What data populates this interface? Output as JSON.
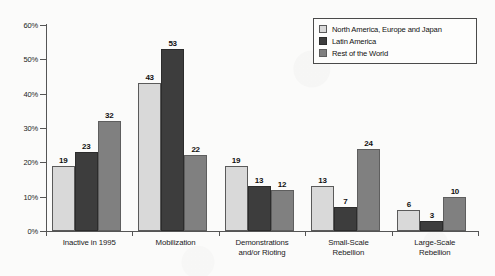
{
  "chart_data": {
    "type": "bar",
    "title": "",
    "subtitle": "",
    "xlabel": "",
    "ylabel": "",
    "ylim": [
      0,
      60
    ],
    "ytick_labels": [
      "0%",
      "10%",
      "20%",
      "30%",
      "40%",
      "50%",
      "60%"
    ],
    "ytick_values": [
      0,
      10,
      20,
      30,
      40,
      50,
      60
    ],
    "grid": false,
    "legend_position": "top-right",
    "value_suffix": "%",
    "categories": [
      "Inactive in 1995",
      "Mobilization",
      "Demonstrations\nand/or Rioting",
      "Small-Scale\nRebellion",
      "Large-Scale\nRebellion"
    ],
    "series": [
      {
        "name": "North America, Europe and Japan",
        "color": "#d9d9d9",
        "values": [
          19,
          43,
          19,
          13,
          6
        ]
      },
      {
        "name": "Latin America",
        "color": "#3d3d3d",
        "values": [
          23,
          53,
          13,
          7,
          3
        ]
      },
      {
        "name": "Rest of the World",
        "color": "#808080",
        "values": [
          32,
          22,
          12,
          24,
          10
        ]
      }
    ]
  },
  "legend": {
    "entries": [
      {
        "label": "North America, Europe and Japan",
        "swatch": "legend-swatch-light-gray"
      },
      {
        "label": "Latin America",
        "swatch": "legend-swatch-dark-gray"
      },
      {
        "label": "Rest of the World",
        "swatch": "legend-swatch-medium-gray"
      }
    ]
  }
}
